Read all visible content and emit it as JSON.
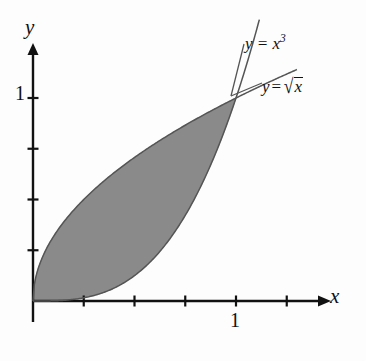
{
  "figure": {
    "kind": "cartesian-plot",
    "background_color": "#fdfdfd",
    "ink_color": "#111111",
    "shaded_region_color": "#8a8a8a"
  },
  "axes": {
    "x_axis_label": "x",
    "y_axis_label": "y",
    "origin_px": [
      33,
      301
    ],
    "unit_px": 203,
    "tick_spacing_units": 0.25,
    "x_ticks": [
      {
        "value": 0.25,
        "label": ""
      },
      {
        "value": 0.5,
        "label": ""
      },
      {
        "value": 0.75,
        "label": ""
      },
      {
        "value": 1,
        "label": "1"
      },
      {
        "value": 1.25,
        "label": ""
      }
    ],
    "y_ticks": [
      {
        "value": 0.25,
        "label": ""
      },
      {
        "value": 0.5,
        "label": ""
      },
      {
        "value": 0.75,
        "label": ""
      },
      {
        "value": 1,
        "label": "1"
      }
    ],
    "x_tick_label": "1",
    "y_tick_label": "1",
    "x_range_units": [
      -0.06,
      1.47
    ],
    "y_range_units": [
      -0.12,
      1.27
    ],
    "grid": false
  },
  "curves": [
    {
      "id": "cubic",
      "label_text": "y = x",
      "label_exponent": "3",
      "expression": "y = x^3",
      "role": "lower-boundary"
    },
    {
      "id": "sqrt",
      "label_lhs": "y",
      "label_op": "=",
      "label_radicand": "x",
      "expression": "y = sqrt(x)",
      "role": "upper-boundary"
    }
  ],
  "intersections": [
    {
      "x": 0,
      "y": 0
    },
    {
      "x": 1,
      "y": 1
    }
  ],
  "chart_data": {
    "type": "area",
    "title": "",
    "xlabel": "x",
    "ylabel": "y",
    "xlim": [
      -0.06,
      1.47
    ],
    "ylim": [
      -0.12,
      1.27
    ],
    "grid": false,
    "legend_position": "inline-curve-labels",
    "shaded_between": [
      "sqrt",
      "cubic"
    ],
    "shade_interval_x": [
      0,
      1
    ],
    "series": [
      {
        "name": "y = x^3",
        "x": [
          0,
          0.1,
          0.2,
          0.3,
          0.4,
          0.5,
          0.6,
          0.7,
          0.8,
          0.9,
          1.0
        ],
        "values": [
          0,
          0.001,
          0.008,
          0.027,
          0.064,
          0.125,
          0.216,
          0.343,
          0.512,
          0.729,
          1.0
        ]
      },
      {
        "name": "y = sqrt(x)",
        "x": [
          0,
          0.1,
          0.2,
          0.3,
          0.4,
          0.5,
          0.6,
          0.7,
          0.8,
          0.9,
          1.0
        ],
        "values": [
          0,
          0.316,
          0.447,
          0.548,
          0.632,
          0.707,
          0.775,
          0.837,
          0.894,
          0.949,
          1.0
        ]
      }
    ]
  }
}
